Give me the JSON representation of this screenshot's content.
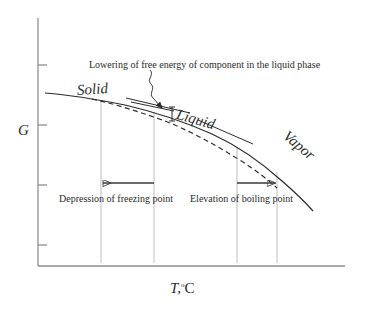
{
  "figure": {
    "type": "diagram",
    "kind": "free-energy vs temperature phase diagram",
    "background_color": "#ffffff",
    "ink_color": "#2b2b2b",
    "guide_color": "#b9b9b9"
  },
  "axes": {
    "y_label": "G",
    "x_label_symbol": "T,",
    "x_label_degree": "o",
    "x_label_unit": "C",
    "y_axis_x": 38,
    "y_axis_top": 18,
    "x_axis_y": 266,
    "x_axis_left": 38,
    "x_axis_right": 345,
    "y_ticks": [
      65,
      125,
      185,
      245
    ],
    "tick_length": 9,
    "grid": false
  },
  "curves": {
    "solid": {
      "name": "pure-component-free-energy",
      "style": "solid",
      "points": "45,93 70,96 100,100 130,106 160,114 190,124 215,135 240,149 265,166 285,183 300,197 312,210"
    },
    "dashed": {
      "name": "solution-free-energy",
      "style": "dashed",
      "points": "92,99 115,104 140,111 165,120 190,131 215,144 238,158 258,172 275,186"
    },
    "tangents": [
      {
        "name": "solid-phase-tangent",
        "x1": 125,
        "y1": 98,
        "x2": 188,
        "y2": 112
      },
      {
        "name": "liquid-phase-tangent",
        "x1": 196,
        "y1": 119,
        "x2": 252,
        "y2": 143
      },
      {
        "name": "vapor-phase-tangent",
        "x1": 131,
        "y1": 101,
        "x2": 166,
        "y2": 108
      }
    ]
  },
  "labels": {
    "solid": "Solid",
    "liquid": "Liquid",
    "vapor": "Vapor",
    "annotation": "Lowering of free energy of component in the liquid phase",
    "freezing": "Depression of freezing point",
    "boiling": "Elevation of boiling point"
  },
  "verticals": [
    {
      "name": "freezing-point-solution",
      "x": 101,
      "y_top": 100,
      "y_bottom": 262
    },
    {
      "name": "freezing-point-pure",
      "x": 154,
      "y_top": 112,
      "y_bottom": 262
    },
    {
      "name": "boiling-point-pure",
      "x": 237,
      "y_top": 147,
      "y_bottom": 262
    },
    {
      "name": "boiling-point-solution",
      "x": 277,
      "y_top": 172,
      "y_bottom": 262
    }
  ],
  "measure_arrows": [
    {
      "name": "freezing-depression-arrow",
      "x1": 154,
      "x2": 101,
      "y": 183,
      "direction": "left"
    },
    {
      "name": "boiling-elevation-arrow",
      "x1": 237,
      "x2": 277,
      "y": 183,
      "direction": "right"
    }
  ],
  "leader": {
    "name": "annotation-leader",
    "path": "M 150,71 C 154,76 147,80 152,85 C 157,90 150,93 155,98 L 163,109",
    "arrow_tip_x": 163,
    "arrow_tip_y": 110
  },
  "gap_marker": {
    "name": "free-energy-gap-marker",
    "x": 171,
    "y_top": 108,
    "y_bottom": 122
  }
}
